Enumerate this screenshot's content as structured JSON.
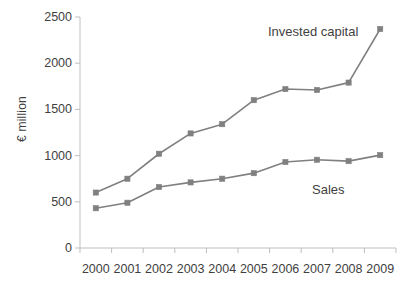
{
  "chart_data": {
    "type": "line",
    "title": "",
    "xlabel": "",
    "ylabel": "€ million",
    "categories": [
      "2000",
      "2001",
      "2002",
      "2003",
      "2004",
      "2005",
      "2006",
      "2007",
      "2008",
      "2009"
    ],
    "series": [
      {
        "name": "Invested capital",
        "values": [
          600,
          750,
          1020,
          1240,
          1340,
          1600,
          1720,
          1710,
          1790,
          2370
        ],
        "color": "#808080",
        "marker": "square",
        "label_position": "inline-top-right"
      },
      {
        "name": "Sales",
        "values": [
          430,
          490,
          660,
          710,
          750,
          810,
          930,
          955,
          940,
          1005
        ],
        "color": "#808080",
        "marker": "square",
        "label_position": "inline-bottom-right"
      }
    ],
    "ylim": [
      0,
      2500
    ],
    "y_ticks": [
      0,
      500,
      1000,
      1500,
      2000,
      2500
    ],
    "y_tick_labels": [
      "0",
      "500",
      "1000",
      "1500",
      "2000",
      "2500"
    ],
    "grid": false,
    "legend": "inline-labels",
    "axis_color": "#bfbfbf"
  },
  "labels": {
    "invested_capital": "Invested capital",
    "sales": "Sales",
    "y_axis_title": "€ million"
  }
}
